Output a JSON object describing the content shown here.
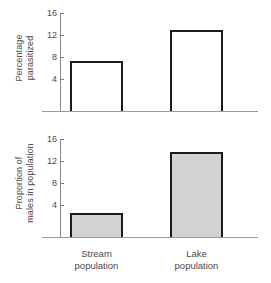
{
  "chart_data": {
    "type": "bar",
    "title": "",
    "subtitle": "",
    "categories": [
      "Stream population",
      "Lake population"
    ],
    "category_lines": [
      [
        "Stream",
        "population"
      ],
      [
        "Lake",
        "population"
      ]
    ],
    "xlabel": "",
    "grid": false,
    "legend": "none",
    "panels": [
      {
        "id": "percentage-parasitized",
        "ylabel": "Percentage parasitized",
        "ylabel_lines": [
          "Percentage",
          "parasitized"
        ],
        "ylim": [
          0,
          17.5
        ],
        "yticks": [
          4,
          8,
          12,
          16
        ],
        "ytick_labels": [
          "4",
          "8",
          "12",
          "16"
        ],
        "values": [
          7.3,
          12.9
        ],
        "bar_fill": "#ffffff",
        "bar_edge": "#1c1c1c"
      },
      {
        "id": "proportion-males-in-population",
        "ylabel": "Proportion of males in population",
        "ylabel_lines": [
          "Proportion of",
          "males in population"
        ],
        "ylim": [
          0,
          17.5
        ],
        "yticks": [
          4,
          8,
          12,
          16
        ],
        "ytick_labels": [
          "4",
          "8",
          "12",
          "16"
        ],
        "values": [
          2.5,
          13.6
        ],
        "bar_fill": "#d2d2d2",
        "bar_edge": "#1c1c1c"
      }
    ]
  },
  "colors": {
    "axis": "#8a8a8a",
    "text": "#4a4a4a",
    "bar_edge": "#1c1c1c",
    "bar_fill_open": "#ffffff",
    "bar_fill_shaded": "#d2d2d2",
    "background": "#ffffff"
  }
}
